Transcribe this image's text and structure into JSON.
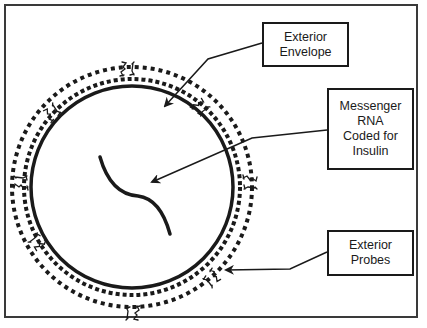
{
  "diagram": {
    "type": "labeled-schematic",
    "labels": {
      "exterior_envelope": "Exterior\nEnvelope",
      "messenger_rna": "Messenger\nRNA\nCoded for\nInsulin",
      "exterior_probes": "Exterior\nProbes"
    },
    "components": [
      {
        "name": "solid-membrane",
        "shape": "circle",
        "style": "solid"
      },
      {
        "name": "inner-dotted-ring",
        "shape": "circle",
        "style": "dotted"
      },
      {
        "name": "outer-dotted-ring",
        "shape": "circle",
        "style": "dotted"
      },
      {
        "name": "mrna-strand",
        "shape": "s-curve",
        "style": "solid"
      },
      {
        "name": "probes",
        "count": 8,
        "style": "small glyph clusters on outer ring"
      }
    ],
    "arrows": [
      {
        "from": "exterior_envelope",
        "to": "inner-dotted-ring"
      },
      {
        "from": "messenger_rna",
        "to": "mrna-strand"
      },
      {
        "from": "exterior_probes",
        "to": "probes"
      }
    ],
    "colors": {
      "ink": "#1a1a1a",
      "frame": "#3a3a3a",
      "background": "#ffffff"
    }
  }
}
